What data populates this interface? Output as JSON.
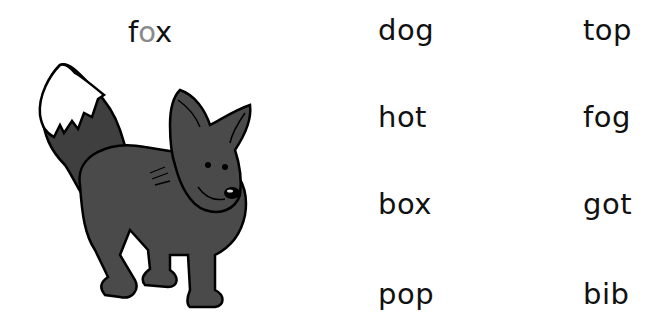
{
  "title": {
    "prefix": "f",
    "highlight": "o",
    "suffix": "x",
    "highlight_color": "#8a8a8a"
  },
  "image": {
    "subject": "fox-illustration"
  },
  "words": {
    "col1": [
      "dog",
      "hot",
      "box",
      "pop"
    ],
    "col2": [
      "top",
      "fog",
      "got",
      "bib"
    ]
  }
}
